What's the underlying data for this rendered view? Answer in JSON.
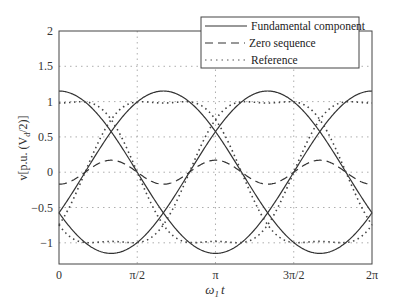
{
  "chart_data": {
    "type": "line",
    "title": "",
    "xlabel": "ω1 t",
    "ylabel": "v[p.u. (Vd/2)]",
    "xlim": [
      0,
      6.2832
    ],
    "ylim": [
      -1.3,
      2
    ],
    "grid": true,
    "legend_position": "upper right",
    "x_ticks": [
      "0",
      "π/2",
      "π",
      "3π/2",
      "2π"
    ],
    "y_ticks": [
      "−1",
      "−0.5",
      "0",
      "0.5",
      "1",
      "1.5",
      "2"
    ],
    "series": [
      {
        "name": "Fundamental component",
        "style": "solid",
        "description": "three sinusoids, amplitude ≈1.15, phases 0, -2π/3, +2π/3",
        "amplitude": 1.15
      },
      {
        "name": "Zero sequence",
        "style": "dashed",
        "description": "third-harmonic, amplitude ≈0.17",
        "amplitude": 0.17
      },
      {
        "name": "Reference",
        "style": "dotted",
        "description": "fundamental + zero sequence, flat-topped at ±1",
        "peak": 1.0
      }
    ]
  },
  "axes": {
    "xlabel_main": "ω",
    "xlabel_sub": "1",
    "xlabel_tail": "t",
    "ylabel_text": "v[p.u. (V",
    "ylabel_sub": "d",
    "ylabel_tail": "/2)]"
  },
  "legend": {
    "items": [
      "Fundamental component",
      "Zero sequence",
      "Reference"
    ]
  }
}
